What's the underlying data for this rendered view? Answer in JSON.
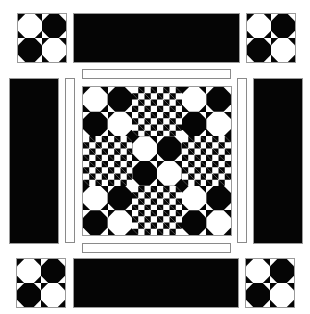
{
  "colors": {
    "dark": "#050505",
    "light": "#ffffff",
    "outline": "#9a9a9a"
  },
  "corner_blocks": [
    {
      "id": "top-left",
      "cells": [
        "w",
        "b",
        "b",
        "w"
      ]
    },
    {
      "id": "top-right",
      "cells": [
        "w",
        "b",
        "b",
        "w"
      ]
    },
    {
      "id": "bottom-left",
      "cells": [
        "w",
        "b",
        "b",
        "w"
      ]
    },
    {
      "id": "bottom-right",
      "cells": [
        "w",
        "b",
        "b",
        "w"
      ]
    }
  ],
  "center_quilt": {
    "grid": 6,
    "layout": [
      [
        "w",
        "b",
        "c",
        "c",
        "w",
        "b"
      ],
      [
        "b",
        "w",
        "c",
        "c",
        "b",
        "w"
      ],
      [
        "c",
        "c",
        "w",
        "b",
        "c",
        "c"
      ],
      [
        "c",
        "c",
        "b",
        "w",
        "c",
        "c"
      ],
      [
        "w",
        "b",
        "c",
        "c",
        "w",
        "b"
      ],
      [
        "b",
        "w",
        "c",
        "c",
        "b",
        "w"
      ]
    ],
    "legend": {
      "w": "white octagon on black",
      "b": "black octagon on white",
      "c": "4x4 checkerboard"
    }
  }
}
